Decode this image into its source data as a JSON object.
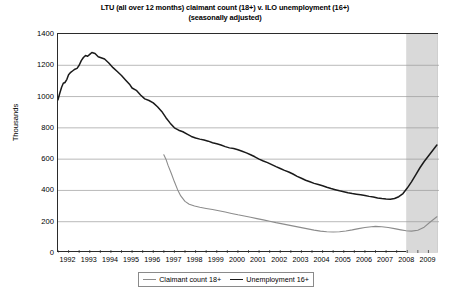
{
  "chart_data": {
    "type": "line",
    "title": "LTU (all over 12 months) claimant count (18+) v. ILO unemployment (16+)",
    "subtitle": "(seasonally adjusted)",
    "xlabel": "",
    "ylabel": "Thousands",
    "ylim": [
      0,
      1400
    ],
    "yticks": [
      0,
      200,
      400,
      600,
      800,
      1000,
      1200,
      1400
    ],
    "xlim": [
      1992.0,
      2010.0
    ],
    "xticks": [
      1992,
      1993,
      1994,
      1995,
      1996,
      1997,
      1998,
      1999,
      2000,
      2001,
      2002,
      2003,
      2004,
      2005,
      2006,
      2007,
      2008,
      2009
    ],
    "grid": "horizontal",
    "legend_position": "bottom",
    "colors": {
      "claimant": "#8c8c8c",
      "unemployment": "#1a1a1a",
      "shading": "#d9d9d9",
      "grid": "#9a9a9a",
      "frame": "#2b2b2b"
    },
    "shaded_region": {
      "label": "recession",
      "x_start": 2008.45,
      "x_end": 2009.95,
      "color": "#d9d9d9"
    },
    "series": [
      {
        "name": "Claimant count 18+",
        "color": "#8c8c8c",
        "x": [
          1997.0,
          1997.1,
          1997.2,
          1997.35,
          1997.5,
          1997.65,
          1997.8,
          1998.0,
          1998.2,
          1998.45,
          1998.7,
          1999.0,
          1999.3,
          1999.6,
          1999.9,
          2000.2,
          2000.5,
          2000.8,
          2001.1,
          2001.4,
          2001.7,
          2002.0,
          2002.3,
          2002.6,
          2002.9,
          2003.2,
          2003.5,
          2003.8,
          2004.1,
          2004.4,
          2004.7,
          2005.0,
          2005.3,
          2005.6,
          2005.9,
          2006.2,
          2006.5,
          2006.8,
          2007.0,
          2007.3,
          2007.6,
          2007.9,
          2008.2,
          2008.45,
          2008.7,
          2009.0,
          2009.3,
          2009.6,
          2009.9
        ],
        "y": [
          628,
          600,
          560,
          510,
          455,
          405,
          365,
          330,
          312,
          300,
          292,
          285,
          278,
          270,
          262,
          253,
          244,
          236,
          228,
          220,
          212,
          203,
          194,
          186,
          178,
          170,
          162,
          154,
          146,
          140,
          136,
          134,
          136,
          141,
          148,
          156,
          163,
          168,
          170,
          168,
          163,
          156,
          148,
          142,
          140,
          145,
          165,
          200,
          232
        ]
      },
      {
        "name": "Unemployment 16+",
        "color": "#1a1a1a",
        "x": [
          1992.0,
          1992.08,
          1992.17,
          1992.25,
          1992.33,
          1992.42,
          1992.5,
          1992.6,
          1992.7,
          1992.8,
          1992.9,
          1993.0,
          1993.1,
          1993.2,
          1993.3,
          1993.4,
          1993.5,
          1993.6,
          1993.75,
          1993.9,
          1994.0,
          1994.2,
          1994.4,
          1994.6,
          1994.8,
          1995.0,
          1995.2,
          1995.4,
          1995.5,
          1995.7,
          1995.9,
          1996.1,
          1996.3,
          1996.5,
          1996.7,
          1996.9,
          1997.1,
          1997.3,
          1997.5,
          1997.7,
          1997.9,
          1998.1,
          1998.3,
          1998.5,
          1998.7,
          1998.9,
          1999.1,
          1999.3,
          1999.5,
          1999.7,
          1999.9,
          2000.1,
          2000.3,
          2000.5,
          2000.7,
          2000.9,
          2001.1,
          2001.3,
          2001.5,
          2001.7,
          2001.9,
          2002.1,
          2002.3,
          2002.5,
          2002.7,
          2002.9,
          2003.1,
          2003.3,
          2003.5,
          2003.7,
          2003.9,
          2004.1,
          2004.3,
          2004.5,
          2004.7,
          2004.9,
          2005.1,
          2005.3,
          2005.5,
          2005.7,
          2005.9,
          2006.1,
          2006.3,
          2006.5,
          2006.7,
          2006.9,
          2007.1,
          2007.3,
          2007.5,
          2007.7,
          2007.9,
          2008.1,
          2008.3,
          2008.5,
          2008.7,
          2008.9,
          2009.1,
          2009.3,
          2009.5,
          2009.7,
          2009.9
        ],
        "y": [
          980,
          1020,
          1060,
          1085,
          1090,
          1110,
          1140,
          1155,
          1165,
          1175,
          1180,
          1200,
          1230,
          1250,
          1262,
          1258,
          1270,
          1282,
          1275,
          1255,
          1250,
          1240,
          1215,
          1185,
          1160,
          1135,
          1105,
          1075,
          1055,
          1040,
          1010,
          985,
          975,
          960,
          935,
          905,
          865,
          830,
          800,
          785,
          775,
          760,
          745,
          735,
          728,
          722,
          715,
          705,
          698,
          690,
          680,
          672,
          668,
          660,
          650,
          640,
          628,
          615,
          600,
          588,
          578,
          565,
          552,
          540,
          528,
          518,
          505,
          490,
          478,
          465,
          455,
          445,
          438,
          430,
          420,
          412,
          405,
          398,
          392,
          385,
          380,
          376,
          372,
          368,
          362,
          358,
          352,
          348,
          345,
          344,
          348,
          360,
          380,
          415,
          455,
          500,
          545,
          585,
          620,
          655,
          690
        ]
      }
    ]
  },
  "axes": {
    "ylabel": "Thousands",
    "ytick_labels": [
      "1400",
      "1200",
      "1000",
      "800",
      "600",
      "400",
      "200",
      "0"
    ],
    "xtick_labels": [
      "1992",
      "1993",
      "1994",
      "1995",
      "1996",
      "1997",
      "1998",
      "1999",
      "2000",
      "2001",
      "2002",
      "2003",
      "2004",
      "2005",
      "2006",
      "2007",
      "2008",
      "2009"
    ]
  },
  "legend": {
    "items": [
      {
        "label": "Claimant count 18+",
        "swatch": "claim"
      },
      {
        "label": "Unemployment 16+",
        "swatch": "unemp"
      }
    ]
  }
}
